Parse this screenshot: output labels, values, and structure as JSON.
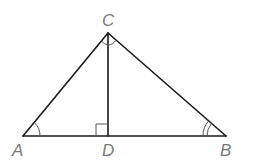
{
  "diagram": {
    "type": "triangle-with-altitude",
    "points": {
      "A": {
        "label": "A",
        "x": 23,
        "y": 136
      },
      "B": {
        "label": "B",
        "x": 226,
        "y": 136
      },
      "C": {
        "label": "C",
        "x": 108,
        "y": 33
      },
      "D": {
        "label": "D",
        "x": 108,
        "y": 136
      }
    },
    "segments": [
      "AC",
      "CB",
      "AB",
      "CD"
    ],
    "angle_marks": {
      "A": "single-arc",
      "B": "double-arc",
      "C": "two-arcs-split-by-altitude",
      "D": "right-angle-square"
    },
    "colors": {
      "line": "#1a1a1a",
      "label": "#7a7a7a"
    }
  }
}
